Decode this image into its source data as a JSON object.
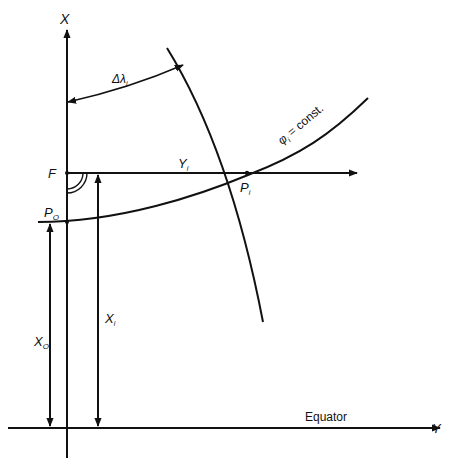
{
  "figure": {
    "type": "Gauss-Krüger / transverse projection coordinate construction",
    "labels": {
      "axis_x": "X",
      "axis_y": "Y",
      "delta_lambda": "Δλ",
      "delta_lambda_sub": "i",
      "footpoint": "F",
      "origin_point": "P",
      "origin_point_sub": "O",
      "y_i": "Y",
      "y_i_sub": "i",
      "p_i": "P",
      "p_i_sub": "i",
      "phi_const": "φ",
      "phi_const_sub": "i",
      "phi_const_rest": " = const.",
      "x_i": "X",
      "x_i_sub": "i",
      "x_o": "X",
      "x_o_sub": "O",
      "equator": "Equator"
    },
    "elements": [
      "central meridian (X axis)",
      "equator (Y axis)",
      "meridian through Pi",
      "parallel φi = const.",
      "ordinate Yi from F to Pi",
      "arc Δλi",
      "right-angle marker at F",
      "distance Xi",
      "distance Xo"
    ],
    "colors": {
      "stroke": "#111111",
      "background": "#ffffff"
    }
  }
}
